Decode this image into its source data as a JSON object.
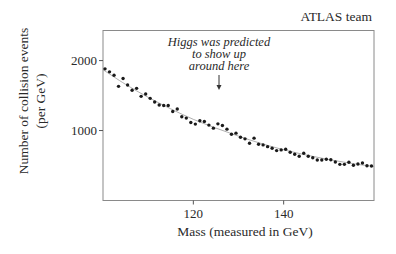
{
  "chart_data": {
    "type": "scatter",
    "title": "ATLAS team",
    "xlabel": "Mass (measured in GeV)",
    "ylabel": "Number of collision events",
    "ylabel_sub": "(per GeV)",
    "xlim": [
      100,
      160
    ],
    "ylim": [
      0,
      2430
    ],
    "x_ticks": [
      120,
      140
    ],
    "x_tick_labels": [
      "120",
      "140"
    ],
    "y_ticks": [
      1000,
      2000
    ],
    "y_tick_labels": [
      "1000",
      "2000"
    ],
    "grid": false,
    "legend": "none",
    "annotation": {
      "lines": [
        "Higgs was predicted",
        "to show up",
        "around here"
      ],
      "arrow_target_x": 125,
      "arrow_target_y": 1200
    },
    "series": [
      {
        "name": "collision events",
        "x": [
          100,
          101,
          102,
          103,
          104,
          105,
          106,
          107,
          108,
          109,
          110,
          111,
          112,
          113,
          114,
          115,
          116,
          117,
          118,
          119,
          120,
          121,
          122,
          123,
          124,
          125,
          126,
          127,
          128,
          129,
          130,
          131,
          132,
          133,
          134,
          135,
          136,
          137,
          138,
          139,
          140,
          141,
          142,
          143,
          144,
          145,
          146,
          147,
          148,
          149,
          150,
          151,
          152,
          153,
          154,
          155,
          156,
          157,
          158,
          159
        ],
        "y": [
          1882,
          1839,
          1790,
          1632,
          1743,
          1652,
          1575,
          1603,
          1489,
          1523,
          1460,
          1408,
          1365,
          1359,
          1359,
          1273,
          1307,
          1197,
          1178,
          1115,
          1092,
          1139,
          1129,
          1078,
          1034,
          1096,
          1072,
          1020,
          948,
          963,
          905,
          881,
          819,
          891,
          805,
          795,
          770,
          747,
          713,
          723,
          733,
          690,
          661,
          632,
          675,
          632,
          612,
          579,
          579,
          589,
          583,
          550,
          517,
          517,
          546,
          503,
          522,
          536,
          497,
          493
        ]
      }
    ],
    "fit": {
      "name": "background fit",
      "x": [
        100,
        105,
        110,
        115,
        120,
        125,
        130,
        135,
        140,
        145,
        150,
        155,
        160
      ],
      "y": [
        1870,
        1660,
        1475,
        1310,
        1160,
        1035,
        920,
        815,
        725,
        650,
        585,
        530,
        485
      ]
    }
  }
}
